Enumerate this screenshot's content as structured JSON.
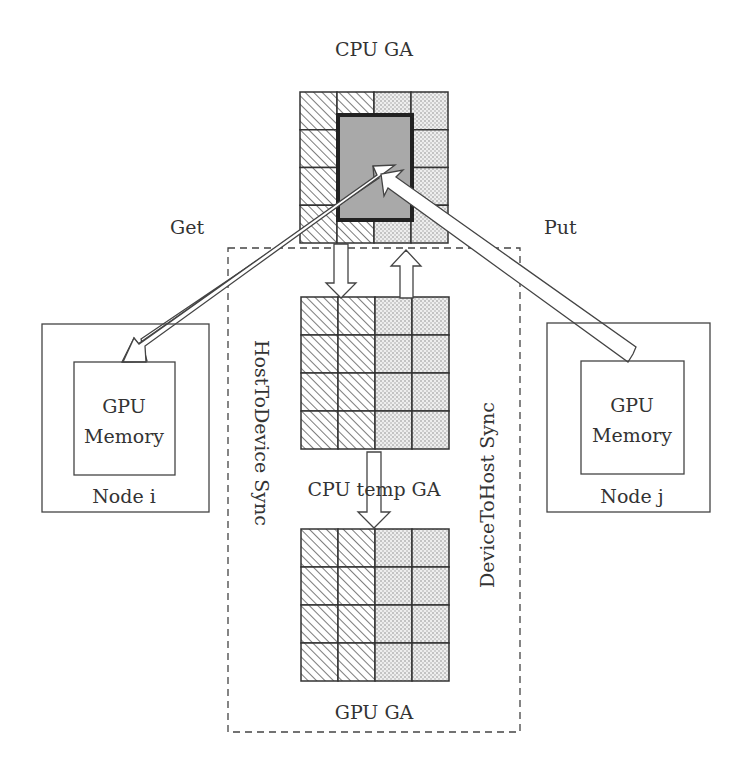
{
  "labels": {
    "cpu_ga": "CPU GA",
    "cpu_temp_ga": "CPU temp GA",
    "gpu_ga": "GPU GA",
    "get": "Get",
    "put": "Put",
    "host_to_device": "HostToDevice Sync",
    "device_to_host": "DeviceToHost Sync",
    "node_i": {
      "name": "Node i",
      "line1": "GPU",
      "line2": "Memory"
    },
    "node_j": {
      "name": "Node j",
      "line1": "GPU",
      "line2": "Memory"
    }
  },
  "grids": {
    "rows": 4,
    "cols": 4,
    "left_pattern": "hatch",
    "right_pattern": "dots",
    "highlight": {
      "on_grid": "cpu_ga",
      "region": "cols 2-3, rows 1-4 (partial)",
      "color": "#a8a8a8"
    }
  },
  "colors": {
    "stroke": "#333333",
    "highlight_fill": "#a9a9a9"
  }
}
